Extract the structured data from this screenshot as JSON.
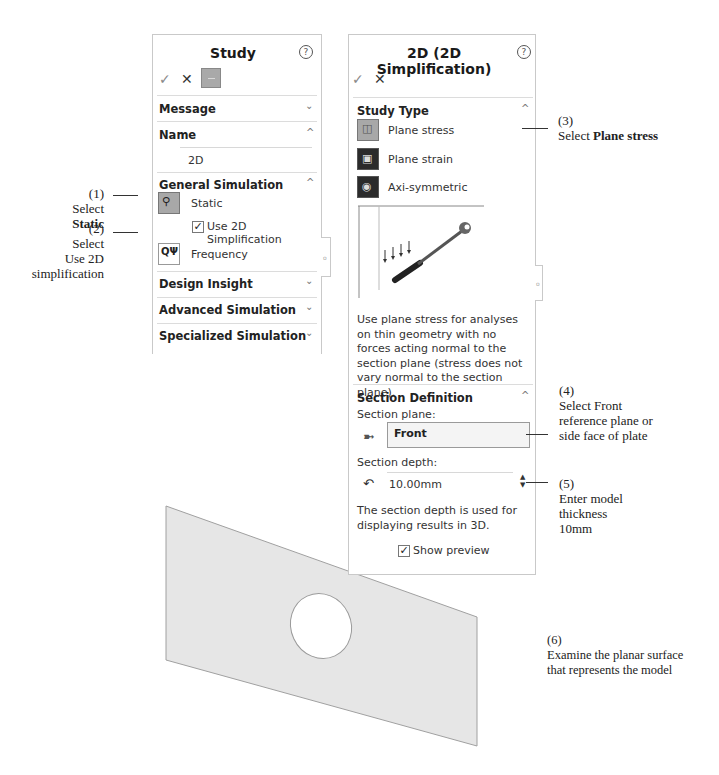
{
  "study_panel": {
    "title": "Study",
    "help_icon": "?",
    "ok_icon": "✓",
    "cancel_icon": "✕",
    "sections": {
      "message": "Message",
      "name": "Name",
      "name_value": "2D",
      "general_simulation": "General Simulation",
      "design_insight": "Design Insight",
      "advanced_simulation": "Advanced Simulation",
      "specialized_simulation": "Specialized Simulation"
    },
    "options": {
      "static": "Static",
      "use_2d": "Use 2D Simplification",
      "use_2d_checked": "✓",
      "frequency": "Frequency"
    }
  },
  "simplification_panel": {
    "title": "2D (2D Simplification)",
    "help_icon": "?",
    "ok_icon": "✓",
    "cancel_icon": "✕",
    "study_type": {
      "heading": "Study Type",
      "options": [
        "Plane stress",
        "Plane strain",
        "Axi-symmetric"
      ],
      "selected": "Plane stress",
      "description": "Use plane stress for analyses on thin geometry with no forces acting normal to the section plane (stress does not vary normal to the section plane)."
    },
    "section_definition": {
      "heading": "Section Definition",
      "plane_label": "Section plane:",
      "plane_value": "Front",
      "depth_label": "Section depth:",
      "depth_value": "10.00mm",
      "depth_note": "The section depth is used for displaying results in 3D.",
      "show_preview": "Show preview",
      "show_preview_checked": "✓"
    }
  },
  "annotations": {
    "step1": {
      "num": "(1)",
      "pre": "Select ",
      "bold": "Static"
    },
    "step2": {
      "num": "(2)",
      "line1": "Select",
      "line2": "Use 2D",
      "line3": "simplification"
    },
    "step3": {
      "num": "(3)",
      "pre": "Select ",
      "bold": "Plane stress"
    },
    "step4": {
      "num": "(4)",
      "line1": "Select Front",
      "line2": "reference plane or",
      "line3": "side face of plate"
    },
    "step5": {
      "num": "(5)",
      "line1": "Enter model",
      "line2": "thickness",
      "line3": "10mm"
    },
    "step6": {
      "num": "(6)",
      "line1": "Examine the planar surface",
      "line2": "that represents the model"
    }
  },
  "colors": {
    "plate_fill": "#e6e6e6",
    "plate_edge": "#a0a0a0",
    "selected_tile": "#a8a8a8"
  }
}
